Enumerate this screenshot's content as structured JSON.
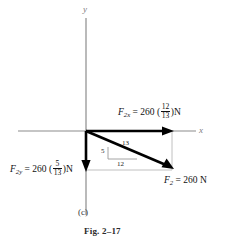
{
  "figure": {
    "caption": "Fig. 2–17",
    "panel_letter": "(c)",
    "background_color": "#ffffff"
  },
  "axes": {
    "x_label": "x",
    "y_label": "y",
    "axis_color": "#8c8c8c",
    "origin": {
      "x": 86,
      "y": 131
    }
  },
  "vectors": {
    "fx": {
      "symbol": "F",
      "subscript": "2x",
      "equals": "=",
      "magnitude": "260",
      "open_paren": "(",
      "numerator": "12",
      "denominator": "13",
      "close_paren": ")",
      "unit": "N",
      "full_text": "F2x = 260 (12/13)N",
      "color": "#000000",
      "direction": "right"
    },
    "fy": {
      "symbol": "F",
      "subscript": "2y",
      "equals": "=",
      "magnitude": "260",
      "open_paren": "(",
      "numerator": "5",
      "denominator": "13",
      "close_paren": ")",
      "unit": "N",
      "full_text": "F2y = 260 (5/13)N",
      "color": "#000000",
      "direction": "down"
    },
    "resultant": {
      "symbol": "F",
      "subscript": "2",
      "equals": "=",
      "magnitude": "260",
      "unit": "N",
      "full_text": "F2 = 260 N",
      "color": "#000000",
      "direction": "down-right"
    }
  },
  "slope_triangle": {
    "hypotenuse": "13",
    "vertical": "5",
    "horizontal": "12",
    "line_color": "#9a9a9a"
  },
  "construction_lines": {
    "color": "#b5b5b5",
    "description": "thin rectangle connecting component tips"
  }
}
